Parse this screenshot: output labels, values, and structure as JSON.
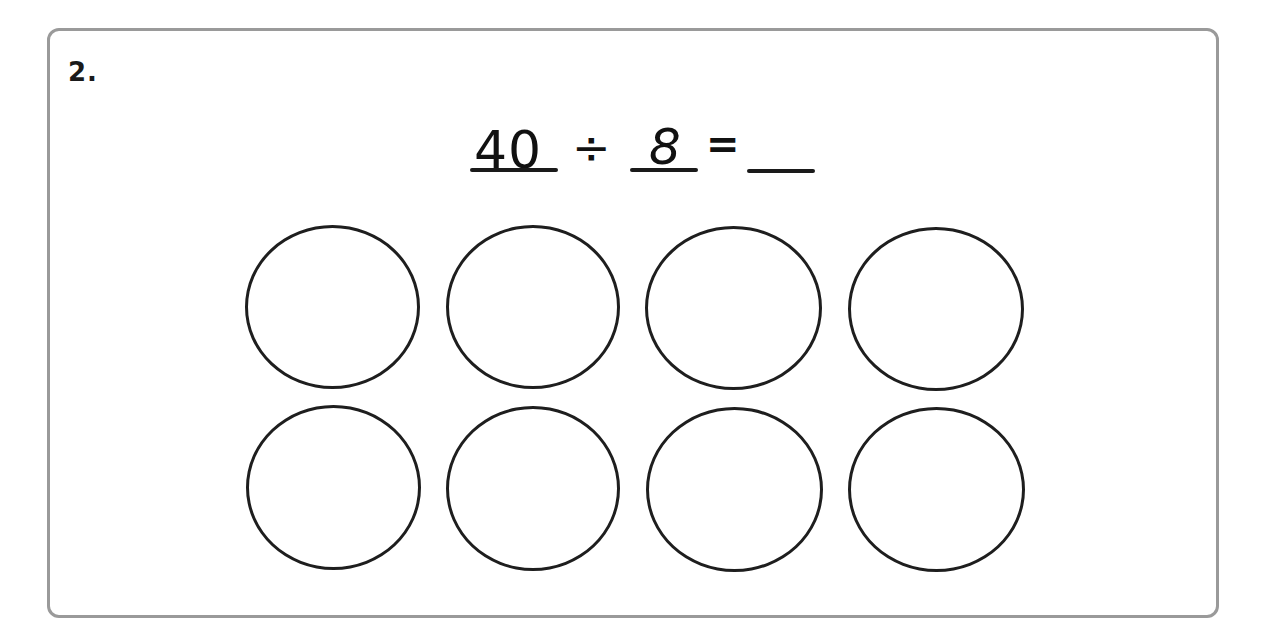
{
  "question": {
    "number": "2.",
    "equation": {
      "dividend": "40",
      "operator": "÷",
      "divisor": "8",
      "equals": "=",
      "quotient": ""
    }
  },
  "groups": {
    "count": 8,
    "rows": 2,
    "columns": 4,
    "circles": [
      {
        "row": 1,
        "col": 1,
        "content": ""
      },
      {
        "row": 1,
        "col": 2,
        "content": ""
      },
      {
        "row": 1,
        "col": 3,
        "content": ""
      },
      {
        "row": 1,
        "col": 4,
        "content": ""
      },
      {
        "row": 2,
        "col": 1,
        "content": ""
      },
      {
        "row": 2,
        "col": 2,
        "content": ""
      },
      {
        "row": 2,
        "col": 3,
        "content": ""
      },
      {
        "row": 2,
        "col": 4,
        "content": ""
      }
    ]
  },
  "colors": {
    "frame_border": "#9a9a9a",
    "ink": "#1a1a1a",
    "background": "#ffffff"
  }
}
